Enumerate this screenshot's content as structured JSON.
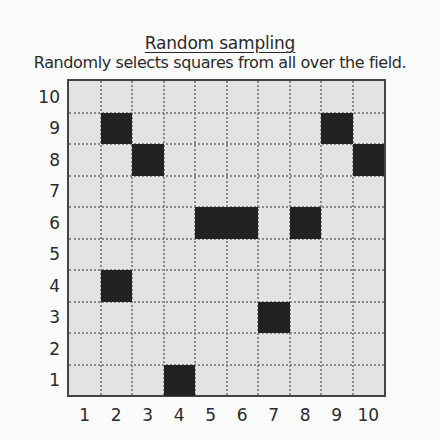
{
  "header": {
    "title": "Random sampling",
    "subtitle": "Randomly selects squares from all over the field."
  },
  "grid": {
    "columns": 10,
    "rows": 10,
    "x_labels": [
      "1",
      "2",
      "3",
      "4",
      "5",
      "6",
      "7",
      "8",
      "9",
      "10"
    ],
    "y_labels": [
      "10",
      "9",
      "8",
      "7",
      "6",
      "5",
      "4",
      "3",
      "2",
      "1"
    ],
    "cell_color": "#e3e3e3",
    "selected_color": "#222222",
    "selected_cells": [
      {
        "col": 2,
        "row": 9
      },
      {
        "col": 3,
        "row": 8
      },
      {
        "col": 9,
        "row": 9
      },
      {
        "col": 10,
        "row": 8
      },
      {
        "col": 5,
        "row": 6
      },
      {
        "col": 6,
        "row": 6
      },
      {
        "col": 8,
        "row": 6
      },
      {
        "col": 2,
        "row": 4
      },
      {
        "col": 7,
        "row": 3
      },
      {
        "col": 4,
        "row": 1
      }
    ]
  }
}
